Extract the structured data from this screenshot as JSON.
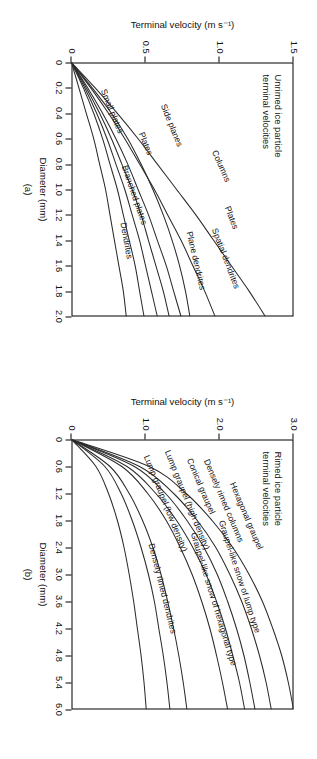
{
  "figure": {
    "panels": [
      {
        "tag": "(a)",
        "note": "Unrimed ice particle\nterminal velocities",
        "xlabel": "Diameter (mm)",
        "ylabel": "Terminal velocity (m s⁻¹)",
        "xticks": [
          "0",
          "0.2",
          "0.4",
          "0.6",
          "0.8",
          "1.0",
          "1.2",
          "1.4",
          "1.6",
          "1.8",
          "2.0"
        ],
        "yticks": [
          "0",
          "0.5",
          "1.0",
          "1.5"
        ],
        "curve_labels": [
          "Columns",
          "Side planes",
          "Plates",
          "Spatial dendrites",
          "Plane dendrites",
          "Dendrites",
          "Branched plates",
          "Plates",
          "Small plates"
        ]
      },
      {
        "tag": "(b)",
        "note": "Rimed ice particle\nterminal velocities",
        "xlabel": "Diameter (mm)",
        "ylabel": "Terminal velocity (m s⁻¹)",
        "xticks": [
          "0",
          "0.6",
          "1.2",
          "1.8",
          "2.4",
          "3.0",
          "3.6",
          "4.2",
          "4.8",
          "5.4",
          "6.0"
        ],
        "yticks": [
          "0",
          "1.0",
          "2.0",
          "3.0"
        ],
        "curve_labels": [
          "Hexagonal graupel",
          "Conical graupel",
          "Densely rimed columns",
          "Lump graupel (high density)",
          "Lump graupel (low density)",
          "Graupel-like snow of lump type",
          "Graupel-like snow of hexagonal type",
          "Densely rimed dendrites"
        ]
      }
    ]
  },
  "chart_data": [
    {
      "type": "line",
      "panel": "(a)",
      "title": "Unrimed ice particle terminal velocities",
      "xlabel": "Diameter (mm)",
      "ylabel": "Terminal velocity (m s⁻¹)",
      "xlim": [
        0,
        2.0
      ],
      "ylim": [
        0,
        1.5
      ],
      "xticks": [
        0,
        0.2,
        0.4,
        0.6,
        0.8,
        1.0,
        1.2,
        1.4,
        1.6,
        1.8,
        2.0
      ],
      "yticks": [
        0,
        0.5,
        1.0,
        1.5
      ],
      "grid": false,
      "legend": "inline-curve-labels",
      "x": [
        0,
        0.2,
        0.4,
        0.6,
        0.8,
        1.0,
        1.2,
        1.4,
        1.6,
        1.8,
        2.0
      ],
      "series": [
        {
          "name": "Columns",
          "values": [
            0.0,
            0.16,
            0.31,
            0.45,
            0.58,
            0.71,
            0.84,
            0.96,
            1.08,
            1.2,
            1.31
          ]
        },
        {
          "name": "Side planes",
          "values": [
            0.0,
            0.13,
            0.25,
            0.36,
            0.46,
            0.56,
            0.65,
            0.74,
            0.82,
            0.9,
            0.97
          ]
        },
        {
          "name": "Plates",
          "values": [
            0.0,
            0.11,
            0.21,
            0.3,
            0.38,
            0.45,
            0.52,
            0.58,
            0.64,
            0.69,
            0.74
          ]
        },
        {
          "name": "Spatial dendrites",
          "values": [
            0.0,
            0.1,
            0.19,
            0.27,
            0.34,
            0.41,
            0.47,
            0.52,
            0.57,
            0.62,
            0.66
          ]
        },
        {
          "name": "Plane dendrites",
          "values": [
            0.0,
            0.09,
            0.17,
            0.24,
            0.3,
            0.36,
            0.41,
            0.46,
            0.5,
            0.54,
            0.58
          ]
        },
        {
          "name": "Branched plates",
          "values": [
            0.0,
            0.08,
            0.15,
            0.21,
            0.26,
            0.31,
            0.35,
            0.39,
            0.43,
            0.46,
            0.49
          ]
        },
        {
          "name": "Dendrites",
          "values": [
            0.0,
            0.05,
            0.1,
            0.15,
            0.19,
            0.23,
            0.26,
            0.29,
            0.32,
            0.35,
            0.37
          ]
        },
        {
          "name": "Small plates",
          "values": [
            0.0,
            0.14,
            0.27,
            0.38,
            0.47,
            0.55,
            0.62,
            0.68,
            0.73,
            0.77,
            0.8
          ]
        }
      ]
    },
    {
      "type": "line",
      "panel": "(b)",
      "title": "Rimed ice particle terminal velocities",
      "xlabel": "Diameter (mm)",
      "ylabel": "Terminal velocity (m s⁻¹)",
      "xlim": [
        0,
        6.0
      ],
      "ylim": [
        0,
        3.0
      ],
      "xticks": [
        0,
        0.6,
        1.2,
        1.8,
        2.4,
        3.0,
        3.6,
        4.2,
        4.8,
        5.4,
        6.0
      ],
      "yticks": [
        0,
        1.0,
        2.0,
        3.0
      ],
      "grid": false,
      "legend": "inline-curve-labels",
      "x": [
        0,
        0.6,
        1.2,
        1.8,
        2.4,
        3.0,
        3.6,
        4.2,
        4.8,
        5.4,
        6.0
      ],
      "series": [
        {
          "name": "Lump graupel (high density)",
          "values": [
            0.0,
            1.05,
            1.55,
            1.9,
            2.18,
            2.4,
            2.58,
            2.72,
            2.84,
            2.93,
            3.0
          ]
        },
        {
          "name": "Conical graupel",
          "values": [
            0.0,
            0.92,
            1.38,
            1.7,
            1.95,
            2.14,
            2.3,
            2.43,
            2.54,
            2.63,
            2.7
          ]
        },
        {
          "name": "Densely rimed columns",
          "values": [
            0.0,
            0.85,
            1.27,
            1.56,
            1.79,
            1.97,
            2.11,
            2.23,
            2.33,
            2.41,
            2.48
          ]
        },
        {
          "name": "Hexagonal graupel",
          "values": [
            0.0,
            0.75,
            1.14,
            1.42,
            1.64,
            1.82,
            1.96,
            2.08,
            2.18,
            2.27,
            2.34
          ]
        },
        {
          "name": "Lump graupel (low density)",
          "values": [
            0.0,
            0.68,
            1.03,
            1.28,
            1.47,
            1.63,
            1.76,
            1.87,
            1.96,
            2.04,
            2.11
          ]
        },
        {
          "name": "Graupel-like snow of lump type",
          "values": [
            0.0,
            0.52,
            0.78,
            0.96,
            1.1,
            1.21,
            1.3,
            1.38,
            1.45,
            1.51,
            1.56
          ]
        },
        {
          "name": "Graupel-like snow of hexagonal type",
          "values": [
            0.0,
            0.45,
            0.67,
            0.82,
            0.94,
            1.04,
            1.12,
            1.18,
            1.24,
            1.29,
            1.33
          ]
        },
        {
          "name": "Densely rimed dendrites",
          "values": [
            0.0,
            0.33,
            0.5,
            0.62,
            0.71,
            0.78,
            0.84,
            0.89,
            0.94,
            0.98,
            1.01
          ]
        }
      ]
    }
  ]
}
